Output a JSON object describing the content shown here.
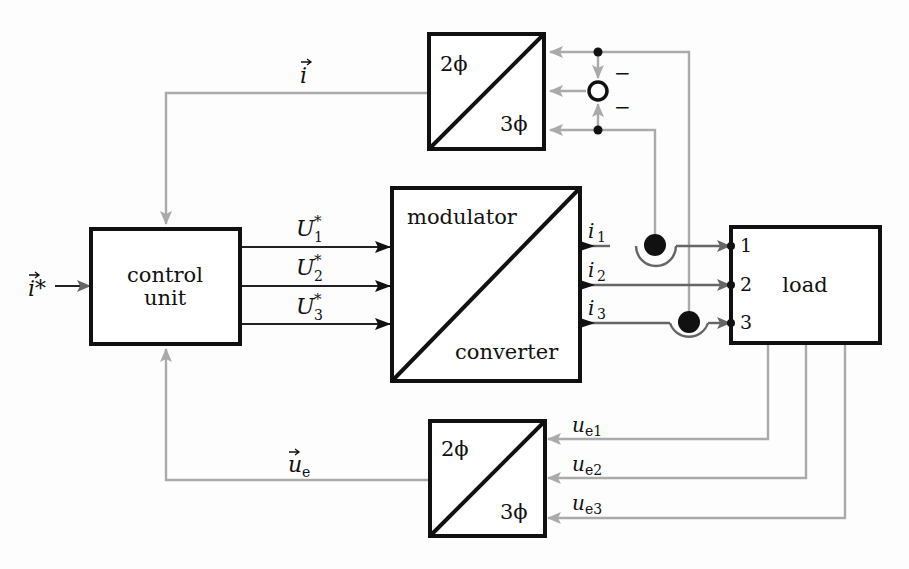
{
  "blocks": {
    "control_unit": {
      "line1": "control",
      "line2": "unit"
    },
    "modulator": {
      "top": "modulator",
      "bottom": "converter"
    },
    "load": {
      "label": "load",
      "ports": [
        "1",
        "2",
        "3"
      ]
    },
    "transform_top": {
      "top": "2ϕ",
      "bottom": "3ϕ"
    },
    "transform_bottom": {
      "top": "2ϕ",
      "bottom": "3ϕ"
    }
  },
  "signals": {
    "i_ref": "i*",
    "i_vec": "i",
    "u_e_vec": "u",
    "u_e_sub": "e",
    "U": [
      {
        "base": "U",
        "sub": "1",
        "sup": "*"
      },
      {
        "base": "U",
        "sub": "2",
        "sup": "*"
      },
      {
        "base": "U",
        "sub": "3",
        "sup": "*"
      }
    ],
    "i": [
      {
        "base": "i",
        "sub": "1"
      },
      {
        "base": "i",
        "sub": "2"
      },
      {
        "base": "i",
        "sub": "3"
      }
    ],
    "ue": [
      {
        "base": "u",
        "sub": "e1"
      },
      {
        "base": "u",
        "sub": "e2"
      },
      {
        "base": "u",
        "sub": "e3"
      }
    ],
    "minus_signs": [
      "−",
      "−"
    ]
  },
  "colors": {
    "block_stroke": "#111111",
    "feedback_line": "#aaaaaa",
    "forward_line": "#222222",
    "current_line": "#666666"
  }
}
